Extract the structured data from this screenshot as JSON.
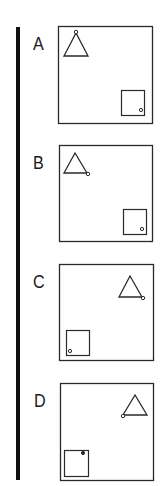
{
  "figure": {
    "options": [
      {
        "label": "A",
        "label_pos": [
          33,
          34
        ],
        "box": [
          58,
          26,
          94,
          97
        ],
        "triangle": {
          "apex": [
            76,
            33
          ],
          "base_left": [
            64,
            56
          ],
          "base_right": [
            88,
            56
          ]
        },
        "triangle_dot": [
          76,
          32
        ],
        "triangle_dot_position": "apex",
        "square": [
          121,
          90,
          23,
          25
        ],
        "square_dot": [
          141,
          110
        ],
        "square_dot_position": "bottom-right"
      },
      {
        "label": "B",
        "label_pos": [
          33,
          153
        ],
        "box": [
          59,
          145,
          93,
          96
        ],
        "triangle": {
          "apex": [
            75,
            153
          ],
          "base_left": [
            64,
            173
          ],
          "base_right": [
            87,
            173
          ]
        },
        "triangle_dot": [
          88,
          174
        ],
        "triangle_dot_position": "bottom-right",
        "square": [
          123,
          209,
          23,
          25
        ],
        "square_dot": [
          142,
          229
        ],
        "square_dot_position": "bottom-right"
      },
      {
        "label": "C",
        "label_pos": [
          33,
          272
        ],
        "box": [
          59,
          264,
          94,
          96
        ],
        "triangle": {
          "apex": [
            130,
            276
          ],
          "base_left": [
            119,
            297
          ],
          "base_right": [
            142,
            297
          ]
        },
        "triangle_dot": [
          143,
          298
        ],
        "triangle_dot_position": "bottom-right",
        "square": [
          66,
          330,
          23,
          25
        ],
        "square_dot": [
          70,
          351
        ],
        "square_dot_position": "bottom-left"
      },
      {
        "label": "D",
        "label_pos": [
          34,
          391
        ],
        "box": [
          60,
          383,
          93,
          97
        ],
        "triangle": {
          "apex": [
            135,
            395
          ],
          "base_left": [
            123,
            415
          ],
          "base_right": [
            147,
            415
          ]
        },
        "triangle_dot": [
          123,
          416
        ],
        "triangle_dot_position": "bottom-left",
        "square": [
          64,
          450,
          24,
          26
        ],
        "square_dot": [
          83,
          453
        ],
        "square_dot_position": "top-right"
      }
    ],
    "colors": {
      "stroke": "#2a2a2a",
      "bar": "#111111",
      "background": "#ffffff"
    }
  }
}
